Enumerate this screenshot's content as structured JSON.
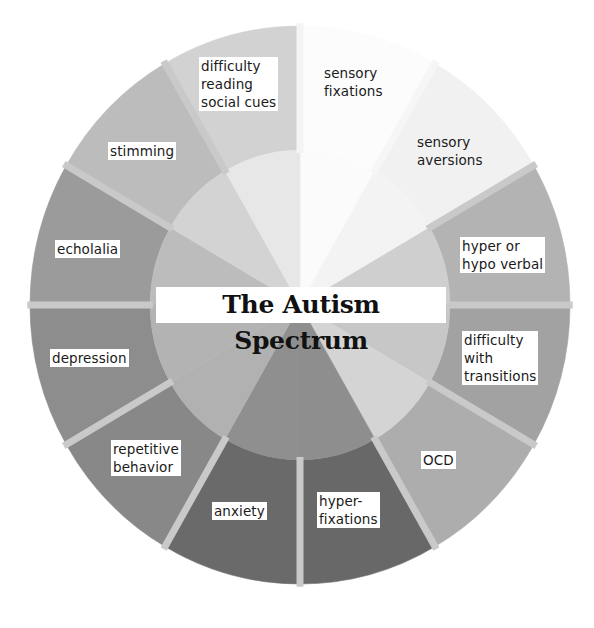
{
  "chart_data": {
    "type": "pie",
    "title": "The Autism Spectrum",
    "style": "donut-wheel, 12 equal segments, grayscale",
    "categories": [
      "sensory fixations",
      "sensory aversions",
      "hyper or hypo verbal",
      "difficulty with transitions",
      "OCD",
      "hyper-fixations",
      "anxiety",
      "repetitive behavior",
      "depression",
      "echolalia",
      "stimming",
      "difficulty reading social cues"
    ],
    "values": [
      1,
      1,
      1,
      1,
      1,
      1,
      1,
      1,
      1,
      1,
      1,
      1
    ],
    "start_angle_deg": 0,
    "direction": "clockwise from top"
  },
  "title": "The Autism Spectrum",
  "segments": [
    {
      "label": "sensory\nfixations",
      "outer": "#fcfcfc",
      "inner": "#fbfbfb",
      "boxed": false,
      "x": 322,
      "y": 64
    },
    {
      "label": "sensory\naversions",
      "outer": "#f1f1f1",
      "inner": "#f3f3f3",
      "boxed": false,
      "x": 415,
      "y": 133
    },
    {
      "label": "hyper or\nhypo verbal",
      "outer": "#b3b3b3",
      "inner": "#cfcfcf",
      "boxed": true,
      "x": 460,
      "y": 237
    },
    {
      "label": "difficulty\nwith\ntransitions",
      "outer": "#a2a2a2",
      "inner": "#c7c7c7",
      "boxed": true,
      "x": 462,
      "y": 331
    },
    {
      "label": "OCD",
      "outer": "#adadad",
      "inner": "#d4d4d4",
      "boxed": true,
      "x": 421,
      "y": 451
    },
    {
      "label": "hyper-\nfixations",
      "outer": "#686868",
      "inner": "#8e8e8e",
      "boxed": true,
      "x": 317,
      "y": 492
    },
    {
      "label": "anxiety",
      "outer": "#6a6a6a",
      "inner": "#8f8f8f",
      "boxed": true,
      "x": 212,
      "y": 502
    },
    {
      "label": "repetitive\nbehavior",
      "outer": "#888888",
      "inner": "#b1b1b1",
      "boxed": true,
      "x": 111,
      "y": 440
    },
    {
      "label": "depression",
      "outer": "#8d8d8d",
      "inner": "#b3b3b3",
      "boxed": true,
      "x": 50,
      "y": 349
    },
    {
      "label": "echolalia",
      "outer": "#9b9b9b",
      "inner": "#bcbcbc",
      "boxed": true,
      "x": 55,
      "y": 240
    },
    {
      "label": "stimming",
      "outer": "#bcbcbc",
      "inner": "#d3d3d3",
      "boxed": true,
      "x": 108,
      "y": 142
    },
    {
      "label": "difficulty\nreading\nsocial cues",
      "outer": "#d2d2d2",
      "inner": "#e7e7e7",
      "boxed": true,
      "x": 199,
      "y": 57
    }
  ],
  "geometry": {
    "cx": 300,
    "cy": 305,
    "rx": 270,
    "ry": 279,
    "inner_ratio": 0.555,
    "gap_color": "#c9c9c9",
    "gap_width": 7
  }
}
